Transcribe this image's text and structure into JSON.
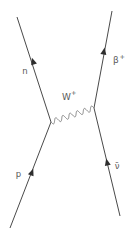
{
  "diagram": {
    "type": "feynman-diagram",
    "labels": {
      "neutron": "n",
      "proton": "p",
      "boson_base": "W",
      "boson_sup": "+",
      "positron_base": "β",
      "positron_sup": "+",
      "antineutrino": "ν̄"
    },
    "colors": {
      "background": "#ffffff",
      "line": "#4a4a4a",
      "boson_line": "#7a7a7a",
      "arrow": "#2e2e2e",
      "label": "#5a5a5a"
    }
  }
}
